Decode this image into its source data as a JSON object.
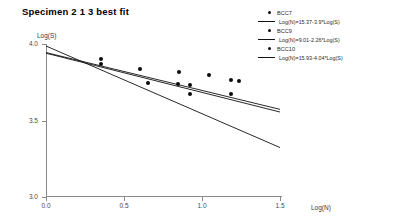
{
  "chart_data": {
    "type": "scatter",
    "title": "Specimen  2 1 3 best fit",
    "xlabel": "Log(N)",
    "ylabel": "Log(S)",
    "xlim": [
      0.0,
      1.5
    ],
    "ylim": [
      3.0,
      4.0
    ],
    "grid": false,
    "legend_position": "top-right",
    "xticks": [
      "0.0",
      "0.5",
      "1.0",
      "1.5"
    ],
    "xtick_values": [
      0.0,
      0.5,
      1.0,
      1.5
    ],
    "yticks": [
      "4.0",
      "3.5",
      "3.0"
    ],
    "ytick_values": [
      4.0,
      3.5,
      3.0
    ],
    "series": [
      {
        "name": "BCC7",
        "marker": "filled-circle",
        "points": [
          {
            "x": 0.355,
            "y": 3.905
          },
          {
            "x": 0.355,
            "y": 3.872
          },
          {
            "x": 0.605,
            "y": 3.835
          },
          {
            "x": 0.855,
            "y": 3.82
          },
          {
            "x": 1.045,
            "y": 3.795
          }
        ]
      },
      {
        "name": "BCC9",
        "marker": "filled-circle",
        "points": [
          {
            "x": 0.655,
            "y": 3.742
          },
          {
            "x": 0.845,
            "y": 3.737
          },
          {
            "x": 0.925,
            "y": 3.73
          },
          {
            "x": 1.185,
            "y": 3.762
          },
          {
            "x": 1.235,
            "y": 3.76
          }
        ]
      },
      {
        "name": "BCC10",
        "marker": "filled-circle",
        "points": [
          {
            "x": 0.925,
            "y": 3.672
          },
          {
            "x": 1.185,
            "y": 3.676
          }
        ]
      }
    ],
    "fit_lines": [
      {
        "name": "BCC7 fit",
        "equation": "Log(N)=15.37-3.9*Log(S)",
        "intercept": 3.94,
        "slope": -0.2564,
        "x_start": 0.0,
        "x_end": 1.5
      },
      {
        "name": "BCC9 fit",
        "equation": "Log(N)=9.01-2.26*Log(S)",
        "intercept": 3.987,
        "slope": -0.4425,
        "x_start": 0.0,
        "x_end": 1.5
      },
      {
        "name": "BCC10 fit",
        "equation": "Log(N)=15.93-4.04*Log(S)",
        "intercept": 3.944,
        "slope": -0.2475,
        "x_start": 0.0,
        "x_end": 1.5
      }
    ]
  },
  "legend": {
    "entries": [
      {
        "label": "BCC7",
        "equation": "Log(N)=15.37-3.9*Log(S)"
      },
      {
        "label": "BCC9",
        "equation": "Log(N)=9.01-2.26*Log(S)"
      },
      {
        "label": "BCC10",
        "equation": "Log(N)=15.93-4.04*Log(S)"
      }
    ]
  },
  "colors": {
    "marker": "#0b0b0b",
    "line": "#111111",
    "axis": "#8a8a8a",
    "text": "#2b2b2b",
    "background": "#ffffff"
  }
}
